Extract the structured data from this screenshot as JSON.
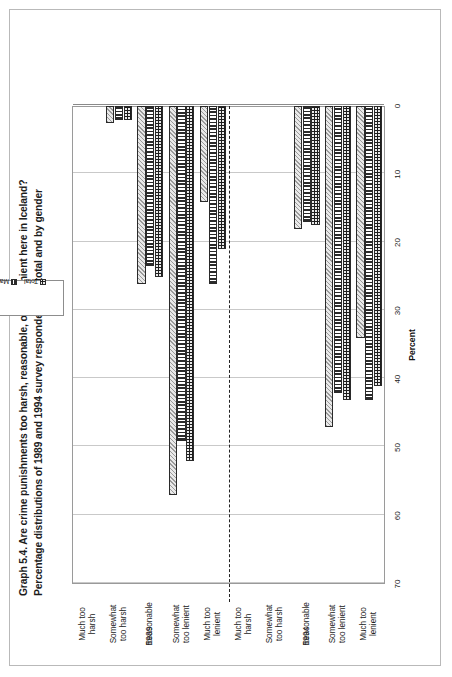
{
  "figure": {
    "title_line1": "Graph 5.4.  Are crime punishments too harsh, reasonable, or too lenient here in Iceland?",
    "title_line2": "Percentage distributions of 1989 and 1994 survey respondents, in total and by gender"
  },
  "legend": {
    "position": "top-center",
    "items": [
      {
        "label": "Total",
        "pattern": "dotted-black",
        "color": "#1d1d1d"
      },
      {
        "label": "Male",
        "pattern": "vertical-stripes",
        "color": "#fbfbfb"
      },
      {
        "label": "Female",
        "pattern": "diagonal-hatch",
        "color": "#dedede"
      }
    ]
  },
  "axes": {
    "value_axis_label": "Percent",
    "value_ticks": [
      "0",
      "10",
      "20",
      "30",
      "40",
      "50",
      "60",
      "70"
    ],
    "value_min": 0,
    "value_max": 70,
    "grid": "value-axis-only"
  },
  "periods": [
    {
      "label": "1989"
    },
    {
      "label": "1994"
    }
  ],
  "categories": [
    "Much too\nharsh",
    "Somewhat\ntoo harsh",
    "Reasonable",
    "Somewhat\ntoo lenient",
    "Much too\nlenient"
  ],
  "chart_data": {
    "type": "bar",
    "orientation": "horizontal",
    "title": "Graph 5.4.  Are crime punishments too harsh, reasonable, or too lenient here in Iceland? Percentage distributions of 1989 and 1994 survey respondents, in total and by gender",
    "xlabel": "",
    "ylabel": "Percent",
    "ylim": [
      0,
      70
    ],
    "yticks": [
      0,
      10,
      20,
      30,
      40,
      50,
      60,
      70
    ],
    "grid": true,
    "legend": [
      "Total",
      "Male",
      "Female"
    ],
    "groups": [
      {
        "period": "1989",
        "categories": [
          "Much too harsh",
          "Somewhat too harsh",
          "Reasonable",
          "Somewhat too lenient",
          "Much too lenient"
        ],
        "series": [
          {
            "name": "Total",
            "values": [
              0,
              2,
              25,
              52,
              21
            ]
          },
          {
            "name": "Male",
            "values": [
              0,
              2,
              23.5,
              49,
              26
            ]
          },
          {
            "name": "Female",
            "values": [
              0,
              2.5,
              26,
              57,
              14
            ]
          }
        ]
      },
      {
        "period": "1994",
        "categories": [
          "Much too harsh",
          "Somewhat too harsh",
          "Reasonable",
          "Somewhat too lenient",
          "Much too lenient"
        ],
        "series": [
          {
            "name": "Total",
            "values": [
              0,
              0,
              17.5,
              43,
              41
            ]
          },
          {
            "name": "Male",
            "values": [
              0,
              0,
              17,
              42,
              43
            ]
          },
          {
            "name": "Female",
            "values": [
              0,
              0,
              18,
              47,
              34
            ]
          }
        ]
      }
    ]
  }
}
